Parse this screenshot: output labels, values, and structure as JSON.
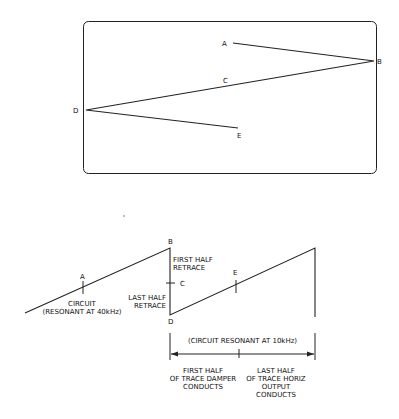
{
  "screen_diagram": {
    "labels": {
      "A": "A",
      "B": "B",
      "C": "C",
      "D": "D",
      "E": "E"
    }
  },
  "waveform_diagram": {
    "labels": {
      "A": "A",
      "B": "B",
      "C": "C",
      "D": "D",
      "E": "E"
    },
    "circuit_40k": "CIRCUIT\n(RESONANT AT 40kHz)",
    "first_half_retrace": "FIRST HALF\nRETRACE",
    "last_half_retrace": "LAST HALF\nRETRACE",
    "circuit_10k": "(CIRCUIT RESONANT AT 10kHz)",
    "damper": "FIRST HALF\nOF TRACE DAMPER\nCONDUCTS",
    "horiz_output": "LAST HALF\nOF TRACE HORIZ\nOUTPUT\nCONDUCTS"
  }
}
